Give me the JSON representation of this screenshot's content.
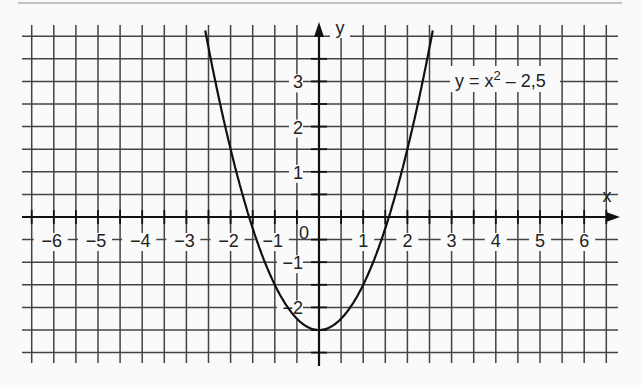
{
  "chart_data": {
    "type": "line",
    "title": "",
    "function_label": "y = x² − 2,5",
    "function_label_parts": {
      "lhs": "y = x",
      "exp": "2",
      "rhs": " – 2,5"
    },
    "xlabel": "x",
    "ylabel": "y",
    "xlim": [
      -6.5,
      6.5
    ],
    "ylim": [
      -3.0,
      4.0
    ],
    "grid": true,
    "grid_step": 0.5,
    "x_ticks": [
      -6,
      -5,
      -4,
      -3,
      -2,
      -1,
      1,
      2,
      3,
      4,
      5,
      6
    ],
    "x_tick_labels": [
      "−6",
      "−5",
      "−4",
      "−3",
      "−2",
      "−1",
      "1",
      "2",
      "3",
      "4",
      "5",
      "6"
    ],
    "y_ticks": [
      3,
      2,
      1,
      -1,
      -2
    ],
    "y_tick_labels": [
      "3",
      "2",
      "1",
      "−1",
      "−2"
    ],
    "origin_label": "0",
    "series": [
      {
        "name": "y = x² − 2,5",
        "x": [
          -2.5,
          -2,
          -1.5,
          -1,
          -0.5,
          0,
          0.5,
          1,
          1.5,
          2,
          2.5
        ],
        "y": [
          3.75,
          1.5,
          -0.25,
          -1.5,
          -2.25,
          -2.5,
          -2.25,
          -1.5,
          -0.25,
          1.5,
          3.75
        ]
      }
    ],
    "roots": [
      -1.58,
      1.58
    ],
    "vertex": [
      0,
      -2.5
    ]
  }
}
